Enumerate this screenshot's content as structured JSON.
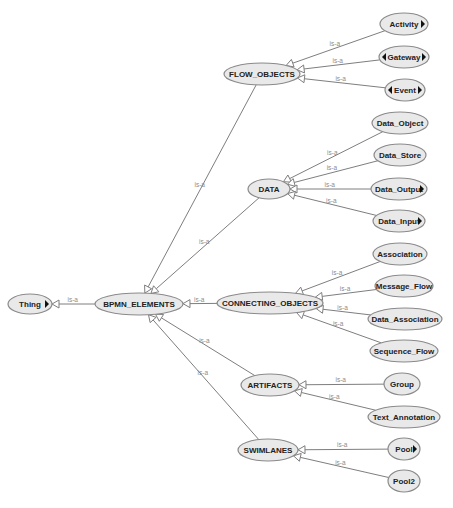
{
  "diagram": {
    "type": "ontology-class-hierarchy",
    "edge_label": "is-a",
    "colors": {
      "node_fill": "#e9e9e9",
      "node_stroke": "#8a8a8a",
      "edge": "#7e7e7e",
      "edge_label": "#8c8c8c",
      "text": "#222222"
    },
    "nodes": [
      {
        "id": "thing",
        "label": "Thing",
        "cx": 30,
        "cy": 304,
        "rx": 22,
        "ry": 10,
        "expand_right": true,
        "expand_left": false
      },
      {
        "id": "bpmn_elements",
        "label": "BPMN_ELEMENTS",
        "cx": 139,
        "cy": 304,
        "rx": 44,
        "ry": 11,
        "expand_right": false,
        "expand_left": false
      },
      {
        "id": "flow_objects",
        "label": "FLOW_OBJECTS",
        "cx": 262,
        "cy": 74,
        "rx": 38,
        "ry": 11,
        "expand_right": false,
        "expand_left": false
      },
      {
        "id": "data",
        "label": "DATA",
        "cx": 269,
        "cy": 189,
        "rx": 21,
        "ry": 10,
        "expand_right": false,
        "expand_left": false
      },
      {
        "id": "connecting_objects",
        "label": "CONNECTING_OBJECTS",
        "cx": 270,
        "cy": 303,
        "rx": 53,
        "ry": 11,
        "expand_right": false,
        "expand_left": false
      },
      {
        "id": "artifacts",
        "label": "ARTIFACTS",
        "cx": 270,
        "cy": 385,
        "rx": 29,
        "ry": 11,
        "expand_right": false,
        "expand_left": false
      },
      {
        "id": "swimlanes",
        "label": "SWIMLANES",
        "cx": 268,
        "cy": 450,
        "rx": 30,
        "ry": 11,
        "expand_right": false,
        "expand_left": false
      },
      {
        "id": "activity",
        "label": "Activity",
        "cx": 404,
        "cy": 24,
        "rx": 24,
        "ry": 11,
        "expand_right": true,
        "expand_left": false
      },
      {
        "id": "gateway",
        "label": "Gateway",
        "cx": 404,
        "cy": 57,
        "rx": 25,
        "ry": 11,
        "expand_right": true,
        "expand_left": true
      },
      {
        "id": "event",
        "label": "Event",
        "cx": 405,
        "cy": 90,
        "rx": 20,
        "ry": 11,
        "expand_right": true,
        "expand_left": true
      },
      {
        "id": "data_object",
        "label": "Data_Object",
        "cx": 400,
        "cy": 123,
        "rx": 28,
        "ry": 11,
        "expand_right": false,
        "expand_left": false
      },
      {
        "id": "data_store",
        "label": "Data_Store",
        "cx": 400,
        "cy": 155,
        "rx": 26,
        "ry": 11,
        "expand_right": false,
        "expand_left": false
      },
      {
        "id": "data_output",
        "label": "Data_Output",
        "cx": 399,
        "cy": 189,
        "rx": 28,
        "ry": 11,
        "expand_right": true,
        "expand_left": false
      },
      {
        "id": "data_input",
        "label": "Data_Input",
        "cx": 399,
        "cy": 221,
        "rx": 26,
        "ry": 11,
        "expand_right": true,
        "expand_left": false
      },
      {
        "id": "association",
        "label": "Association",
        "cx": 400,
        "cy": 254,
        "rx": 27,
        "ry": 11,
        "expand_right": false,
        "expand_left": false
      },
      {
        "id": "message_flow",
        "label": "Message_Flow",
        "cx": 404,
        "cy": 286,
        "rx": 29,
        "ry": 11,
        "expand_right": false,
        "expand_left": false
      },
      {
        "id": "data_association",
        "label": "Data_Association",
        "cx": 405,
        "cy": 319,
        "rx": 37,
        "ry": 11,
        "expand_right": false,
        "expand_left": false
      },
      {
        "id": "sequence_flow",
        "label": "Sequence_Flow",
        "cx": 404,
        "cy": 351,
        "rx": 34,
        "ry": 11,
        "expand_right": false,
        "expand_left": false
      },
      {
        "id": "group",
        "label": "Group",
        "cx": 402,
        "cy": 384,
        "rx": 18,
        "ry": 11,
        "expand_right": false,
        "expand_left": false
      },
      {
        "id": "text_annotation",
        "label": "Text_Annotation",
        "cx": 404,
        "cy": 417,
        "rx": 36,
        "ry": 11,
        "expand_right": false,
        "expand_left": false
      },
      {
        "id": "pool",
        "label": "Pool",
        "cx": 404,
        "cy": 449,
        "rx": 16,
        "ry": 11,
        "expand_right": true,
        "expand_left": false
      },
      {
        "id": "pool2",
        "label": "Pool2",
        "cx": 404,
        "cy": 481,
        "rx": 16,
        "ry": 11,
        "expand_right": false,
        "expand_left": false
      }
    ],
    "edges": [
      {
        "from": "bpmn_elements",
        "to": "thing",
        "label": "is-a"
      },
      {
        "from": "flow_objects",
        "to": "bpmn_elements",
        "label": "is-a"
      },
      {
        "from": "data",
        "to": "bpmn_elements",
        "label": "is-a"
      },
      {
        "from": "connecting_objects",
        "to": "bpmn_elements",
        "label": "is-a"
      },
      {
        "from": "artifacts",
        "to": "bpmn_elements",
        "label": "is-a"
      },
      {
        "from": "swimlanes",
        "to": "bpmn_elements",
        "label": "is-a"
      },
      {
        "from": "activity",
        "to": "flow_objects",
        "label": "is-a"
      },
      {
        "from": "gateway",
        "to": "flow_objects",
        "label": "is-a"
      },
      {
        "from": "event",
        "to": "flow_objects",
        "label": "is-a"
      },
      {
        "from": "data_object",
        "to": "data",
        "label": "is-a"
      },
      {
        "from": "data_store",
        "to": "data",
        "label": "is-a"
      },
      {
        "from": "data_output",
        "to": "data",
        "label": "is-a"
      },
      {
        "from": "data_input",
        "to": "data",
        "label": "is-a"
      },
      {
        "from": "association",
        "to": "connecting_objects",
        "label": "is-a"
      },
      {
        "from": "message_flow",
        "to": "connecting_objects",
        "label": "is-a"
      },
      {
        "from": "data_association",
        "to": "connecting_objects",
        "label": "is-a"
      },
      {
        "from": "sequence_flow",
        "to": "connecting_objects",
        "label": "is-a"
      },
      {
        "from": "group",
        "to": "artifacts",
        "label": "is-a"
      },
      {
        "from": "text_annotation",
        "to": "artifacts",
        "label": "is-a"
      },
      {
        "from": "pool",
        "to": "swimlanes",
        "label": "is-a"
      },
      {
        "from": "pool2",
        "to": "swimlanes",
        "label": "is-a"
      }
    ]
  }
}
